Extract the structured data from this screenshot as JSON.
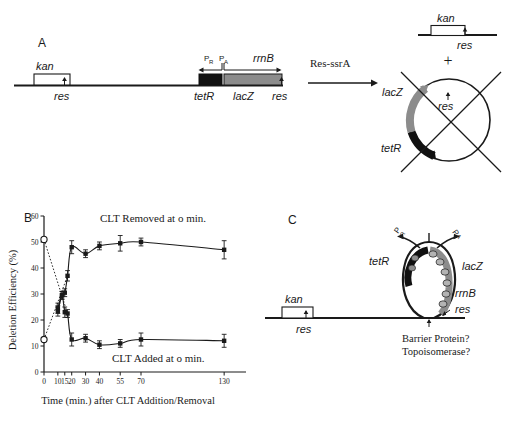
{
  "figure": {
    "panels": [
      {
        "id": "A",
        "label": "A"
      },
      {
        "id": "B",
        "label": "B"
      },
      {
        "id": "C",
        "label": "C"
      }
    ]
  },
  "panel_a": {
    "label": "A",
    "construct": {
      "kan_label": "kan",
      "res_left_label": "res",
      "tetR_label": "tetR",
      "lacZ_label": "lacZ",
      "rrnB_label": "rrnB",
      "res_right_label": "res",
      "promoter_r": "P",
      "promoter_r_sub": "R",
      "promoter_a": "P",
      "promoter_a_sub": "A"
    },
    "reaction_label": "Res-ssrA",
    "products": {
      "linear": {
        "kan_label": "kan",
        "res_label": "res"
      },
      "plus": "+",
      "circle": {
        "lacZ_label": "lacZ",
        "tetR_label": "tetR",
        "res_label": "res"
      }
    }
  },
  "panel_b": {
    "label": "B",
    "chart_data": {
      "type": "scatter",
      "title": "",
      "xlabel": "Time (min.) after CLT  Addition/Removal",
      "ylabel": "Deletion Efficiency (%)",
      "xlim": [
        0,
        140
      ],
      "ylim": [
        0,
        60
      ],
      "xticks": [
        0,
        10,
        15,
        20,
        30,
        40,
        55,
        70,
        130
      ],
      "xticklabels": [
        "0",
        "10",
        "15",
        "20",
        "30",
        "40",
        "55",
        "70",
        "130"
      ],
      "yticks": [
        0,
        10,
        20,
        30,
        40,
        50,
        60
      ],
      "yticklabels": [
        "0",
        "10",
        "20",
        "30",
        "40",
        "50",
        "60"
      ],
      "grid": false,
      "legend_position": "inline-annotations",
      "annotations": [
        {
          "text": "CLT  Removed at o min.",
          "x": 55,
          "y": 57
        },
        {
          "text": "CLT Added at o min.",
          "x": 62,
          "y": 7
        }
      ],
      "series": [
        {
          "name": "CLT Removed at o min.",
          "marker": "filled-square",
          "x": [
            0,
            10,
            13,
            15,
            17,
            20,
            30,
            40,
            55,
            70,
            130
          ],
          "y": [
            12.5,
            23.5,
            29.5,
            30.5,
            37,
            48,
            45.5,
            48.5,
            49.5,
            50,
            47
          ],
          "yerr": [
            2.5,
            2.0,
            1.5,
            1.5,
            2.0,
            2.5,
            1.5,
            1.5,
            3.0,
            1.5,
            3.5
          ],
          "open_start_point": {
            "x": 0,
            "y": 12.5
          }
        },
        {
          "name": "CLT Added at o min.",
          "marker": "filled-square",
          "x": [
            0,
            10,
            13,
            15,
            17,
            20,
            30,
            40,
            55,
            70,
            130
          ],
          "y": [
            51,
            24.5,
            29.5,
            23,
            22.5,
            12.5,
            13,
            10.5,
            11,
            12.5,
            12
          ],
          "yerr": [
            2.0,
            2.0,
            1.5,
            2.0,
            1.5,
            2.5,
            1.5,
            1.5,
            1.5,
            2.5,
            2.5
          ],
          "open_start_point": {
            "x": 0,
            "y": 51
          }
        }
      ],
      "dotted_guide_lines": true
    }
  },
  "panel_c": {
    "label": "C",
    "kan_label": "kan",
    "res_left_label": "res",
    "tetR_label": "tetR",
    "lacZ_label": "lacZ",
    "rrnB_label": "rrnB",
    "res_loop_label": "res",
    "promoter_r": "P",
    "promoter_r_sub": "R",
    "promoter_a": "P",
    "promoter_a_sub": "A",
    "question_line_1": "Barrier Protein?",
    "question_line_2": "Topoisomerase?"
  },
  "colors": {
    "ink": "#1a1a1a",
    "lacZ_gray": "#8c8c8c",
    "tetR_black": "#111111",
    "white": "#ffffff"
  }
}
